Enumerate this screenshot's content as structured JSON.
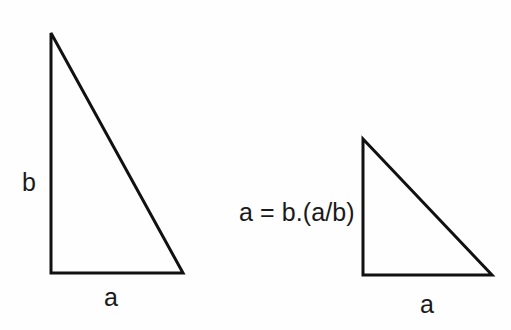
{
  "figure": {
    "kind": "geometry-diagram",
    "background_color": "#fefefe",
    "stroke_color": "#111111",
    "text_color": "#1a1a1a",
    "stroke_width": 3,
    "width": 511,
    "height": 330
  },
  "equation": {
    "text": "a = b.(a/b)"
  },
  "shapes": {
    "left_triangle": {
      "name": "large-right-triangle",
      "points": "51,33 51,273 183,273",
      "labels": {
        "vertical_leg": "b",
        "horizontal_leg": "a"
      }
    },
    "right_triangle": {
      "name": "small-right-triangle",
      "points": "363,139 363,275 492,275",
      "labels": {
        "horizontal_leg": "a"
      }
    }
  },
  "labels": {
    "b_left": "b",
    "a_left": "a",
    "a_right": "a"
  },
  "chart_data": {
    "type": "diagram",
    "title": "",
    "annotations": [
      "b",
      "a",
      "a = b.(a/b)",
      "a"
    ],
    "elements": [
      {
        "id": "large-right-triangle",
        "vertices": [
          [
            51,
            33
          ],
          [
            51,
            273
          ],
          [
            183,
            273
          ]
        ],
        "leg_vertical_label": "b",
        "leg_horizontal_label": "a"
      },
      {
        "id": "small-right-triangle",
        "vertices": [
          [
            363,
            139
          ],
          [
            363,
            275
          ],
          [
            492,
            275
          ]
        ],
        "leg_horizontal_label": "a"
      }
    ]
  }
}
